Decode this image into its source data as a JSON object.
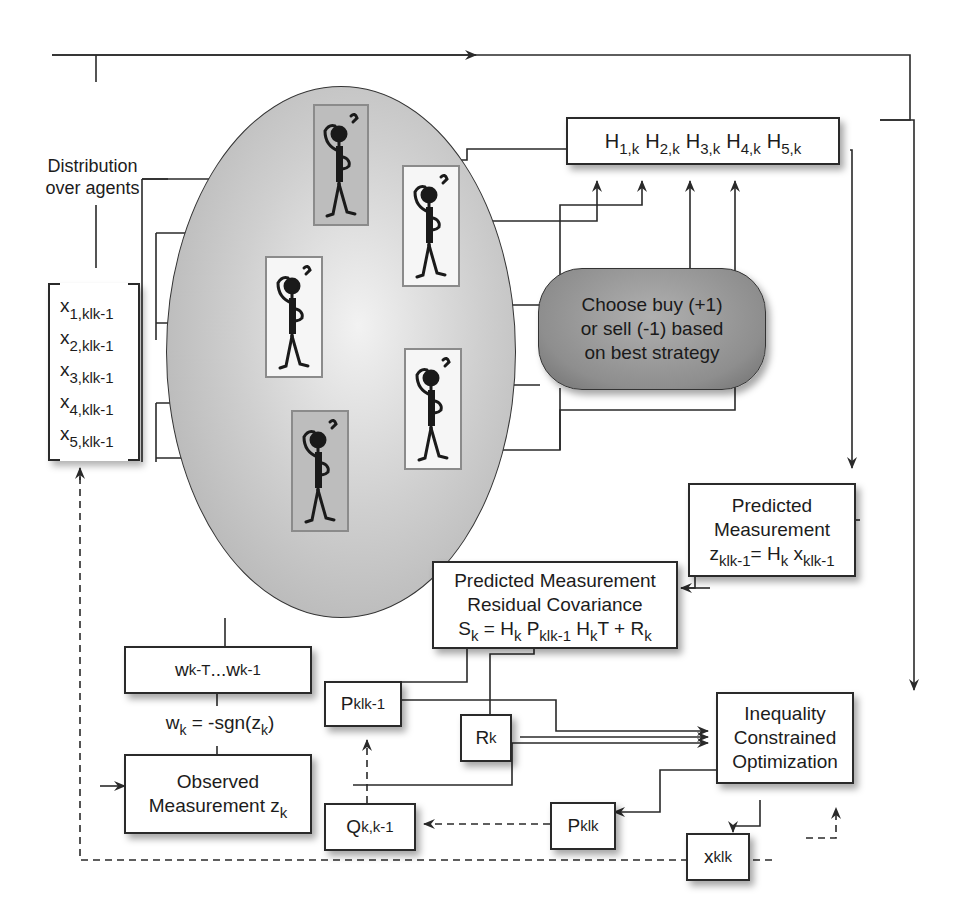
{
  "diagram": {
    "distribution_label": [
      "Distribution",
      "over agents"
    ],
    "state_vector": {
      "rows": [
        {
          "base": "x",
          "sub": "1,klk-1"
        },
        {
          "base": "x",
          "sub": "2,klk-1"
        },
        {
          "base": "x",
          "sub": "3,klk-1"
        },
        {
          "base": "x",
          "sub": "4,klk-1"
        },
        {
          "base": "x",
          "sub": "5,klk-1"
        }
      ]
    },
    "agents": [
      {
        "name": "agent-1",
        "shade": "shaded"
      },
      {
        "name": "agent-2",
        "shade": "light"
      },
      {
        "name": "agent-3",
        "shade": "light"
      },
      {
        "name": "agent-4",
        "shade": "light"
      },
      {
        "name": "agent-5",
        "shade": "shaded"
      }
    ],
    "h_matrix": {
      "items": [
        {
          "base": "H",
          "sub": "1,k"
        },
        {
          "base": "H",
          "sub": "2,k"
        },
        {
          "base": "H",
          "sub": "3,k"
        },
        {
          "base": "H",
          "sub": "4,k"
        },
        {
          "base": "H",
          "sub": "5,k"
        }
      ]
    },
    "strategy_node": {
      "lines": [
        "Choose buy (+1)",
        "or sell (-1) based",
        "on best strategy"
      ]
    },
    "predicted_measurement": {
      "line1": "Predicted",
      "line2": "Measurement",
      "eq": {
        "z": "z",
        "z_sub": "klk-1",
        "eq_mid": "= H",
        "h_sub": "k",
        "x": " x",
        "x_sub": "klk-1"
      }
    },
    "residual_covariance": {
      "line1": "Predicted Measurement",
      "line2": "Residual Covariance",
      "eq": {
        "s": "S",
        "s_sub": "k",
        "a": " = H",
        "a_sub": "k",
        "p": " P",
        "p_sub": "klk-1",
        "h": " H",
        "h_sub": "k",
        "tail": "T + R",
        "r_sub": "k"
      }
    },
    "weights_box": {
      "w1": "w",
      "w1_sub": "k-T",
      "dots": " ... ",
      "w2": "w",
      "w2_sub": "k-1"
    },
    "weight_rule": {
      "w": "w",
      "w_sub": "k",
      "mid": " = -sgn(",
      "z": "z",
      "z_sub": "k",
      "end": ")"
    },
    "p_prior": {
      "base": "P",
      "sub": "klk-1"
    },
    "r_box": {
      "base": "R",
      "sub": "k"
    },
    "observed_measurement": {
      "line1": "Observed",
      "line2": "Measurement z",
      "sub": "k"
    },
    "q_box": {
      "base": "Q",
      "sub": "k,k-1"
    },
    "p_post": {
      "base": "P",
      "sub": "klk"
    },
    "x_post": {
      "base": "x",
      "sub": "klk"
    },
    "optimizer": {
      "lines": [
        "Inequality",
        "Constrained",
        "Optimization"
      ]
    }
  },
  "colors": {
    "line": "#2a2a2a",
    "ellipse_fill": "#b5b5b5",
    "pill_fill": "#8e8e8e",
    "agent_border": "#8b8b8b"
  }
}
